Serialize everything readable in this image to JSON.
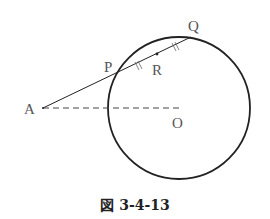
{
  "figure": {
    "labels": {
      "A": "A",
      "P": "P",
      "Q": "Q",
      "R": "R",
      "O": "O"
    },
    "caption": "図 3-4-13"
  }
}
